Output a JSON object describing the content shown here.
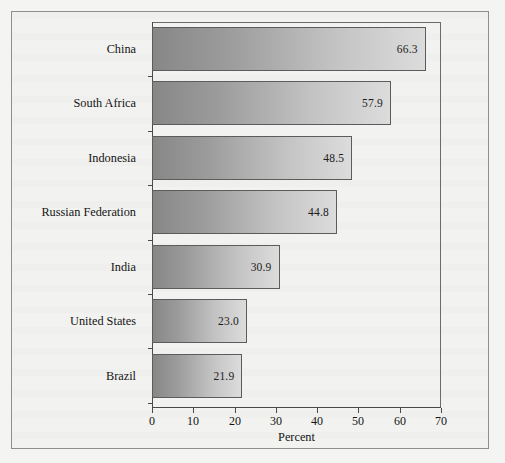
{
  "chart_data": {
    "type": "bar",
    "orientation": "horizontal",
    "title": "",
    "xlabel": "Percent",
    "ylabel": "",
    "xlim": [
      0,
      70
    ],
    "xticks": [
      0,
      10,
      20,
      30,
      40,
      50,
      60,
      70
    ],
    "xtick_labels": [
      "0",
      "10",
      "20",
      "30",
      "40",
      "50",
      "60",
      "70"
    ],
    "grid": false,
    "legend": false,
    "categories": [
      "China",
      "South Africa",
      "Indonesia",
      "Russian Federation",
      "India",
      "United States",
      "Brazil"
    ],
    "values": [
      66.3,
      57.9,
      48.5,
      44.8,
      30.9,
      23.0,
      21.9
    ],
    "value_labels": [
      "66.3",
      "57.9",
      "48.5",
      "44.8",
      "30.9",
      "23.0",
      "21.9"
    ],
    "bar_fill": "linear-gradient dark-gray to light-gray",
    "bar_color_start": "#878787",
    "bar_color_end": "#dcdcdc",
    "bar_border_color": "#5c5c5c",
    "axis_color": "#4a4a4a",
    "frame_color": "#8e8e8e",
    "background_color": "#f2f2f0"
  }
}
